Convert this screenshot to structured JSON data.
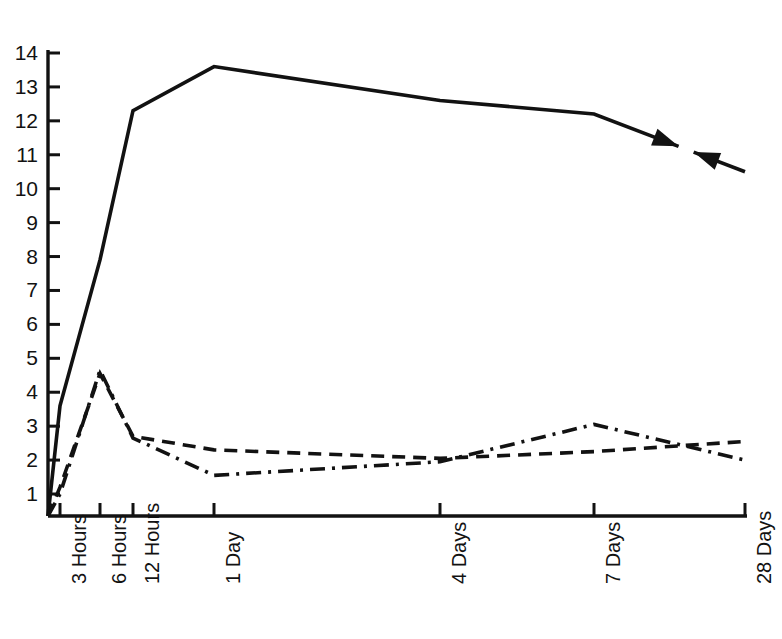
{
  "chart_data": {
    "type": "line",
    "title": "",
    "subtitle": "",
    "xlabel": "",
    "ylabel": "",
    "categories": [
      "3 Hours",
      "6 Hours",
      "12 Hours",
      "1 Day",
      "4 Days",
      "7 Days",
      "28 Days"
    ],
    "x_positions": [
      60,
      100,
      133,
      214,
      440,
      594,
      745
    ],
    "y_ticks": [
      1,
      2,
      3,
      4,
      5,
      6,
      7,
      8,
      9,
      10,
      11,
      12,
      13,
      14
    ],
    "ytick_labels": [
      "1",
      "2",
      "3",
      "4",
      "5",
      "6",
      "7",
      "8",
      "9",
      "10",
      "11",
      "12",
      "13",
      "14"
    ],
    "ylim": [
      0,
      14
    ],
    "grid": false,
    "legend": "none",
    "axis_color": "#121212",
    "series": [
      {
        "name": "solid-series",
        "style": "solid",
        "color": "#121212",
        "categories": [
          "3 Hours",
          "6 Hours",
          "12 Hours",
          "1 Day",
          "4 Days",
          "7 Days",
          "28 Days"
        ],
        "values": [
          3.6,
          7.9,
          12.3,
          13.6,
          12.6,
          12.2,
          10.5
        ],
        "origin_value": 0.0,
        "has_break": true,
        "break_note": "line interrupted between 7 Days and 28 Days by two opposing arrowheads"
      },
      {
        "name": "dashed-series",
        "style": "dashed",
        "color": "#121212",
        "categories": [
          "3 Hours",
          "6 Hours",
          "12 Hours",
          "1 Day",
          "4 Days",
          "7 Days",
          "28 Days"
        ],
        "values": [
          1.2,
          4.55,
          2.7,
          2.3,
          2.05,
          2.25,
          2.55
        ],
        "origin_value": 0.0
      },
      {
        "name": "dash-dot-series",
        "style": "dash-dot",
        "color": "#121212",
        "categories": [
          "3 Hours",
          "6 Hours",
          "12 Hours",
          "1 Day",
          "4 Days",
          "7 Days",
          "28 Days"
        ],
        "values": [
          1.0,
          4.65,
          2.65,
          1.55,
          1.95,
          3.05,
          2.0
        ],
        "origin_value": 0.0
      }
    ],
    "annotations": [
      {
        "name": "arrow-right-pointing",
        "description": "arrowhead at end of solid segment pointing right-down toward gap"
      },
      {
        "name": "arrow-left-pointing",
        "description": "arrowhead pointing left-up at start of final solid segment"
      }
    ]
  },
  "axes": {
    "y_axis_name": "y-axis",
    "x_axis_name": "x-axis"
  }
}
